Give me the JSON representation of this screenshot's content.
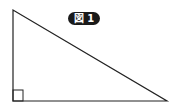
{
  "figure": {
    "label": "図 1",
    "shape": "right-triangle",
    "vertices": {
      "top_left": [
        13,
        10
      ],
      "bottom_left": [
        13,
        101
      ],
      "bottom_right": [
        167,
        101
      ]
    },
    "right_angle_marker": "bottom-left",
    "colors": {
      "stroke": "#222222",
      "label_bg": "#1a1a1a",
      "label_text": "#ffffff"
    }
  }
}
